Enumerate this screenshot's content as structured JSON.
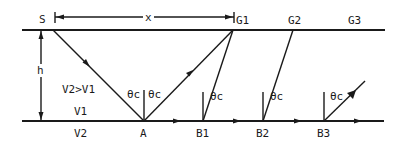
{
  "diagram": {
    "labels": {
      "source": "S",
      "offset": "x",
      "thickness": "h",
      "velocity_relation": "V2>V1",
      "upper_layer_velocity": "V1",
      "lower_layer_velocity": "V2",
      "critical_point": "A",
      "critical_angle": "θc"
    },
    "geophones": [
      {
        "label": "G1",
        "x": 233
      },
      {
        "label": "G2",
        "x": 293
      },
      {
        "label": "G3",
        "x": 353
      }
    ],
    "refraction_points": [
      {
        "label": "B1",
        "x": 203
      },
      {
        "label": "B2",
        "x": 263
      },
      {
        "label": "B3",
        "x": 324
      }
    ],
    "geometry": {
      "surface_y": 30,
      "interface_y": 121,
      "source_x": 53,
      "critical_point_x": 144,
      "line_left_x": 22,
      "line_right_x": 385
    },
    "colors": {
      "ink": "#1a1a1a",
      "background": "#ffffff"
    }
  }
}
